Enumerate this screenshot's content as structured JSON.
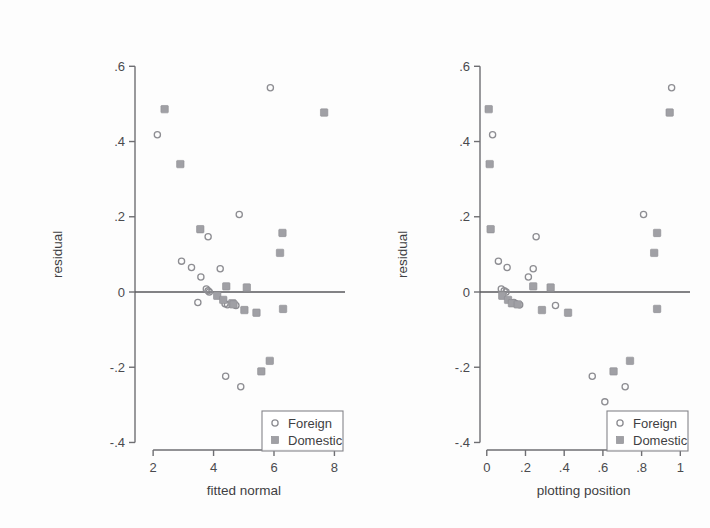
{
  "figure": {
    "panel_count": 2,
    "background_color": "#fdfdfd"
  },
  "chart_data": [
    {
      "type": "scatter",
      "panel": "left",
      "title": "",
      "xlabel": "fitted normal",
      "ylabel": "residual",
      "xlim": [
        1.4,
        8.35
      ],
      "ylim": [
        -0.42,
        0.63
      ],
      "xticks": [
        2,
        4,
        6,
        8
      ],
      "xticklabels": [
        "2",
        "4",
        "6",
        "8"
      ],
      "yticks": [
        0.6,
        0.4,
        0.2,
        0,
        -0.2,
        -0.4
      ],
      "yticklabels": [
        ".6",
        ".4",
        ".2",
        "0",
        "-.2",
        "-.4"
      ],
      "grid": false,
      "reference_line": {
        "orientation": "horizontal",
        "y": 0
      },
      "legend": {
        "position": "bottom-right",
        "entries": [
          {
            "label": "Foreign",
            "marker": "open-circle",
            "color": "#8d8d92"
          },
          {
            "label": "Domestic",
            "marker": "filled-square",
            "color": "#a0a0a5"
          }
        ]
      },
      "series": [
        {
          "name": "Foreign",
          "marker": "open-circle",
          "color": "#8d8d92",
          "points": [
            [
              2.14,
              0.418
            ],
            [
              5.88,
              0.543
            ],
            [
              4.85,
              0.206
            ],
            [
              3.82,
              0.147
            ],
            [
              2.94,
              0.082
            ],
            [
              3.27,
              0.065
            ],
            [
              3.58,
              0.04
            ],
            [
              3.76,
              0.008
            ],
            [
              3.82,
              0.003
            ],
            [
              3.86,
              0.0
            ],
            [
              4.22,
              0.062
            ],
            [
              3.48,
              -0.028
            ],
            [
              4.38,
              -0.031
            ],
            [
              4.46,
              -0.034
            ],
            [
              4.74,
              -0.036
            ],
            [
              4.4,
              -0.224
            ],
            [
              4.9,
              -0.252
            ]
          ]
        },
        {
          "name": "Domestic",
          "marker": "filled-square",
          "color": "#a0a0a5",
          "points": [
            [
              2.38,
              0.486
            ],
            [
              7.66,
              0.477
            ],
            [
              2.9,
              0.34
            ],
            [
              3.56,
              0.167
            ],
            [
              6.28,
              0.157
            ],
            [
              6.2,
              0.104
            ],
            [
              4.42,
              0.015
            ],
            [
              5.1,
              0.012
            ],
            [
              4.12,
              -0.01
            ],
            [
              4.32,
              -0.021
            ],
            [
              4.62,
              -0.03
            ],
            [
              4.66,
              -0.033
            ],
            [
              5.02,
              -0.048
            ],
            [
              6.3,
              -0.045
            ],
            [
              5.42,
              -0.055
            ],
            [
              5.86,
              -0.183
            ],
            [
              5.58,
              -0.211
            ]
          ]
        }
      ]
    },
    {
      "type": "scatter",
      "panel": "right",
      "title": "",
      "xlabel": "plotting position",
      "ylabel": "residual",
      "xlim": [
        -0.035,
        1.05
      ],
      "ylim": [
        -0.42,
        0.63
      ],
      "xticks": [
        0,
        0.2,
        0.4,
        0.6,
        0.8,
        1
      ],
      "xticklabels": [
        "0",
        ".2",
        ".4",
        ".6",
        ".8",
        "1"
      ],
      "yticks": [
        0.6,
        0.4,
        0.2,
        0,
        -0.2,
        -0.4
      ],
      "yticklabels": [
        ".6",
        ".4",
        ".2",
        "0",
        "-.2",
        "-.4"
      ],
      "grid": false,
      "reference_line": {
        "orientation": "horizontal",
        "y": 0
      },
      "legend": {
        "position": "bottom-right",
        "entries": [
          {
            "label": "Foreign",
            "marker": "open-circle",
            "color": "#8d8d92"
          },
          {
            "label": "Domestic",
            "marker": "filled-square",
            "color": "#a0a0a5"
          }
        ]
      },
      "series": [
        {
          "name": "Foreign",
          "marker": "open-circle",
          "color": "#8d8d92",
          "points": [
            [
              0.03,
              0.418
            ],
            [
              0.955,
              0.543
            ],
            [
              0.81,
              0.206
            ],
            [
              0.255,
              0.147
            ],
            [
              0.06,
              0.082
            ],
            [
              0.105,
              0.065
            ],
            [
              0.215,
              0.04
            ],
            [
              0.075,
              0.008
            ],
            [
              0.09,
              0.003
            ],
            [
              0.1,
              0.0
            ],
            [
              0.24,
              0.062
            ],
            [
              0.14,
              -0.028
            ],
            [
              0.15,
              -0.031
            ],
            [
              0.17,
              -0.034
            ],
            [
              0.355,
              -0.036
            ],
            [
              0.545,
              -0.224
            ],
            [
              0.715,
              -0.252
            ],
            [
              0.61,
              -0.292
            ]
          ]
        },
        {
          "name": "Domestic",
          "marker": "filled-square",
          "color": "#a0a0a5",
          "points": [
            [
              0.01,
              0.486
            ],
            [
              0.945,
              0.477
            ],
            [
              0.015,
              0.34
            ],
            [
              0.02,
              0.167
            ],
            [
              0.88,
              0.157
            ],
            [
              0.865,
              0.104
            ],
            [
              0.24,
              0.015
            ],
            [
              0.33,
              0.012
            ],
            [
              0.08,
              -0.01
            ],
            [
              0.11,
              -0.021
            ],
            [
              0.13,
              -0.03
            ],
            [
              0.16,
              -0.033
            ],
            [
              0.285,
              -0.048
            ],
            [
              0.88,
              -0.045
            ],
            [
              0.42,
              -0.055
            ],
            [
              0.74,
              -0.183
            ],
            [
              0.655,
              -0.211
            ]
          ]
        }
      ]
    }
  ]
}
